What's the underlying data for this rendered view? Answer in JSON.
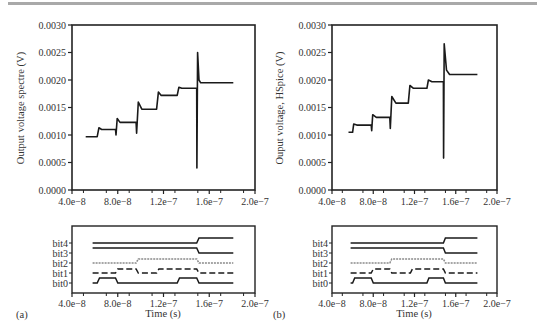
{
  "chart_data": [
    {
      "id": "a_top",
      "type": "line",
      "panel": "(a)",
      "title": "",
      "xlabel": "",
      "ylabel": "Output voltage spectre (V)",
      "xlim": [
        4e-08,
        2e-07
      ],
      "ylim": [
        0.0,
        0.003
      ],
      "xticks": [
        "4.0e−8",
        "8.0e−8",
        "1.2e−7",
        "1.6e−7",
        "2.0e−7"
      ],
      "yticks": [
        "0.0000",
        "0.0005",
        "0.0010",
        "0.0015",
        "0.0020",
        "0.0025",
        "0.0030"
      ],
      "grid": false,
      "series": [
        {
          "name": "Output voltage (Spectre)",
          "x": [
            5.2e-08,
            6.2e-08,
            6.35e-08,
            6.6e-08,
            7.8e-08,
            7.85e-08,
            7.95e-08,
            8.2e-08,
            9.6e-08,
            9.65e-08,
            9.8e-08,
            1.01e-07,
            1.14e-07,
            1.155e-07,
            1.18e-07,
            1.32e-07,
            1.335e-07,
            1.36e-07,
            1.49e-07,
            1.492e-07,
            1.498e-07,
            1.51e-07,
            1.525e-07,
            1.81e-07
          ],
          "y": [
            0.00097,
            0.00097,
            0.00113,
            0.0011,
            0.0011,
            0.001,
            0.0013,
            0.00123,
            0.00123,
            0.00103,
            0.0016,
            0.00147,
            0.00147,
            0.00178,
            0.00172,
            0.00172,
            0.00187,
            0.00185,
            0.00185,
            0.0004,
            0.0025,
            0.002,
            0.00195,
            0.00195
          ]
        }
      ]
    },
    {
      "id": "b_top",
      "type": "line",
      "panel": "(b)",
      "title": "",
      "xlabel": "",
      "ylabel": "Ouput voltage, HSpice (V)",
      "xlim": [
        4e-08,
        2e-07
      ],
      "ylim": [
        0.0,
        0.003
      ],
      "xticks": [
        "4.0e−8",
        "8.0e−8",
        "1.2e−7",
        "1.6e−7",
        "2.0e−7"
      ],
      "yticks": [
        "0.0000",
        "0.0005",
        "0.0010",
        "0.0015",
        "0.0020",
        "0.0025",
        "0.0030"
      ],
      "grid": false,
      "series": [
        {
          "name": "Output voltage (HSpice)",
          "x": [
            5.6e-08,
            6e-08,
            6.1e-08,
            6.4e-08,
            7.8e-08,
            7.85e-08,
            7.95e-08,
            8.3e-08,
            9.6e-08,
            9.65e-08,
            9.8e-08,
            1.02e-07,
            1.14e-07,
            1.155e-07,
            1.19e-07,
            1.32e-07,
            1.335e-07,
            1.37e-07,
            1.48e-07,
            1.482e-07,
            1.488e-07,
            1.51e-07,
            1.54e-07,
            1.81e-07
          ],
          "y": [
            0.00105,
            0.00105,
            0.0012,
            0.00118,
            0.00118,
            0.00108,
            0.00137,
            0.00132,
            0.00132,
            0.00112,
            0.0017,
            0.00158,
            0.00158,
            0.0019,
            0.00185,
            0.00185,
            0.002,
            0.00197,
            0.00197,
            0.00058,
            0.00266,
            0.00218,
            0.0021,
            0.0021
          ]
        }
      ]
    },
    {
      "id": "a_bottom",
      "type": "line",
      "panel": "(a)",
      "title": "",
      "xlabel": "Time (s)",
      "ylabel": "",
      "xlim": [
        4e-08,
        2e-07
      ],
      "xticks": [
        "4.0e−8",
        "8.0e−8",
        "1.2e−7",
        "1.6e−7",
        "2.0e−7"
      ],
      "yticks": [
        "bit0",
        "bit1",
        "bit2",
        "bit3",
        "bit4"
      ],
      "series": [
        {
          "name": "bit4",
          "style": "solid",
          "x": [
            5.8e-08,
            1.49e-07,
            1.51e-07,
            1.81e-07
          ],
          "level": [
            0,
            0,
            1,
            1
          ]
        },
        {
          "name": "bit3",
          "style": "solid",
          "x": [
            5.8e-08,
            1.49e-07,
            1.51e-07,
            1.81e-07
          ],
          "level": [
            1,
            1,
            0,
            0
          ]
        },
        {
          "name": "bit2",
          "style": "dotted-gray",
          "x": [
            5.8e-08,
            9.6e-08,
            9.8e-08,
            1.49e-07,
            1.51e-07,
            1.81e-07
          ],
          "level": [
            0,
            0,
            1,
            1,
            0,
            0
          ]
        },
        {
          "name": "bit1",
          "style": "dashed",
          "x": [
            5.8e-08,
            7.8e-08,
            8e-08,
            9.6e-08,
            9.8e-08,
            1.14e-07,
            1.16e-07,
            1.49e-07,
            1.51e-07,
            1.81e-07
          ],
          "level": [
            0,
            0,
            1,
            1,
            0,
            0,
            1,
            1,
            0,
            0
          ]
        },
        {
          "name": "bit0",
          "style": "solid",
          "x": [
            5.8e-08,
            6.2e-08,
            6.4e-08,
            7.8e-08,
            8e-08,
            1.32e-07,
            1.34e-07,
            1.49e-07,
            1.51e-07,
            1.81e-07
          ],
          "level": [
            0,
            0,
            1,
            1,
            0,
            0,
            1,
            1,
            0,
            0
          ]
        }
      ]
    },
    {
      "id": "b_bottom",
      "type": "line",
      "panel": "(b)",
      "title": "",
      "xlabel": "Time (s)",
      "ylabel": "",
      "xlim": [
        4e-08,
        2e-07
      ],
      "xticks": [
        "4.0e−8",
        "8.0e−8",
        "1.2e−7",
        "1.6e−7",
        "2.0e−7"
      ],
      "yticks": [
        "bit0",
        "bit1",
        "bit2",
        "bit3",
        "bit4"
      ],
      "series": [
        {
          "name": "bit4",
          "style": "solid",
          "x": [
            5.8e-08,
            1.48e-07,
            1.5e-07,
            1.81e-07
          ],
          "level": [
            0,
            0,
            1,
            1
          ]
        },
        {
          "name": "bit3",
          "style": "solid",
          "x": [
            5.8e-08,
            1.48e-07,
            1.5e-07,
            1.81e-07
          ],
          "level": [
            1,
            1,
            0,
            0
          ]
        },
        {
          "name": "bit2",
          "style": "dotted-gray",
          "x": [
            5.8e-08,
            9.6e-08,
            9.8e-08,
            1.48e-07,
            1.5e-07,
            1.81e-07
          ],
          "level": [
            0,
            0,
            1,
            1,
            0,
            0
          ]
        },
        {
          "name": "bit1",
          "style": "dashed",
          "x": [
            5.8e-08,
            7.8e-08,
            8e-08,
            9.6e-08,
            9.8e-08,
            1.16e-07,
            1.18e-07,
            1.48e-07,
            1.5e-07,
            1.81e-07
          ],
          "level": [
            0,
            0,
            1,
            1,
            0,
            0,
            1,
            1,
            0,
            0
          ]
        },
        {
          "name": "bit0",
          "style": "solid",
          "x": [
            5.8e-08,
            6e-08,
            6.2e-08,
            7.8e-08,
            8e-08,
            1.32e-07,
            1.34e-07,
            1.48e-07,
            1.5e-07,
            1.81e-07
          ],
          "level": [
            0,
            0,
            1,
            1,
            0,
            0,
            1,
            1,
            0,
            0
          ]
        }
      ]
    }
  ],
  "labels": {
    "panel_a": "(a)",
    "panel_b": "(b)",
    "ylabel_a": "Output voltage spectre (V)",
    "ylabel_b": "Ouput voltage, HSpice (V)",
    "xlabel": "Time (s)"
  },
  "colors": {
    "line": "#1a1a1a",
    "bit2": "#8a8a8a",
    "topbar": "#a9a9a9"
  }
}
